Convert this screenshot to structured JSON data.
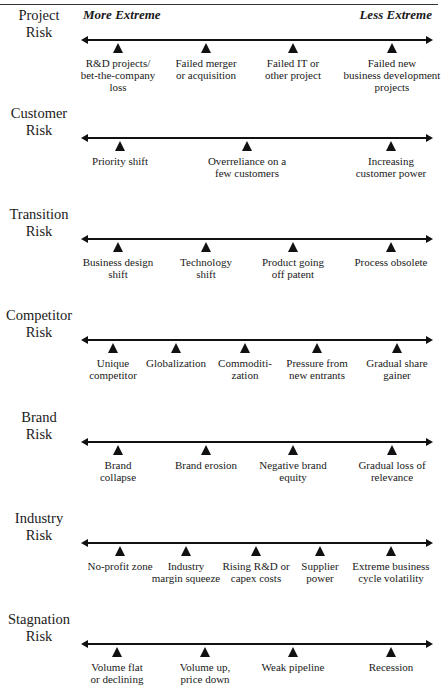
{
  "header": {
    "left_label": "More Extreme",
    "right_label": "Less Extreme"
  },
  "rows": [
    {
      "label_line1": "Project",
      "label_line2": "Risk",
      "line_y": 39,
      "markers": [
        {
          "x": 118,
          "lines": [
            "R&D projects/",
            "bet-the-company",
            "loss"
          ]
        },
        {
          "x": 206,
          "lines": [
            "Failed merger",
            "or acquisition"
          ]
        },
        {
          "x": 293,
          "lines": [
            "Failed IT or",
            "other project"
          ]
        },
        {
          "x": 392,
          "lines": [
            "Failed new",
            "business development",
            "projects"
          ]
        }
      ]
    },
    {
      "label_line1": "Customer",
      "label_line2": "Risk",
      "line_y": 137,
      "markers": [
        {
          "x": 120,
          "lines": [
            "Priority shift"
          ]
        },
        {
          "x": 247,
          "lines": [
            "Overreliance on a",
            "few customers"
          ]
        },
        {
          "x": 391,
          "lines": [
            "Increasing",
            "customer power"
          ]
        }
      ]
    },
    {
      "label_line1": "Transition",
      "label_line2": "Risk",
      "line_y": 238,
      "markers": [
        {
          "x": 118,
          "lines": [
            "Business design",
            "shift"
          ]
        },
        {
          "x": 206,
          "lines": [
            "Technology",
            "shift"
          ]
        },
        {
          "x": 293,
          "lines": [
            "Product going",
            "off patent"
          ]
        },
        {
          "x": 391,
          "lines": [
            "Process obsolete"
          ]
        }
      ]
    },
    {
      "label_line1": "Competitor",
      "label_line2": "Risk",
      "line_y": 339,
      "markers": [
        {
          "x": 113,
          "lines": [
            "Unique",
            "competitor"
          ]
        },
        {
          "x": 176,
          "lines": [
            "Globalization"
          ]
        },
        {
          "x": 245,
          "lines": [
            "Commoditi-",
            "zation"
          ]
        },
        {
          "x": 317,
          "lines": [
            "Pressure from",
            "new entrants"
          ]
        },
        {
          "x": 397,
          "lines": [
            "Gradual share",
            "gainer"
          ]
        }
      ]
    },
    {
      "label_line1": "Brand",
      "label_line2": "Risk",
      "line_y": 441,
      "markers": [
        {
          "x": 118,
          "lines": [
            "Brand",
            "collapse"
          ]
        },
        {
          "x": 206,
          "lines": [
            "Brand erosion"
          ]
        },
        {
          "x": 293,
          "lines": [
            "Negative brand",
            "equity"
          ]
        },
        {
          "x": 392,
          "lines": [
            "Gradual loss of",
            "relevance"
          ]
        }
      ]
    },
    {
      "label_line1": "Industry",
      "label_line2": "Risk",
      "line_y": 542,
      "markers": [
        {
          "x": 120,
          "lines": [
            "No-profit zone"
          ]
        },
        {
          "x": 186,
          "lines": [
            "Industry",
            "margin squeeze"
          ]
        },
        {
          "x": 256,
          "lines": [
            "Rising R&D or",
            "capex costs"
          ]
        },
        {
          "x": 320,
          "lines": [
            "Supplier",
            "power"
          ]
        },
        {
          "x": 391,
          "lines": [
            "Extreme business",
            "cycle volatility"
          ]
        }
      ]
    },
    {
      "label_line1": "Stagnation",
      "label_line2": "Risk",
      "line_y": 643,
      "markers": [
        {
          "x": 117,
          "lines": [
            "Volume flat",
            "or declining"
          ]
        },
        {
          "x": 205,
          "lines": [
            "Volume up,",
            "price down"
          ]
        },
        {
          "x": 293,
          "lines": [
            "Weak pipeline"
          ]
        },
        {
          "x": 391,
          "lines": [
            "Recession"
          ]
        }
      ]
    }
  ]
}
